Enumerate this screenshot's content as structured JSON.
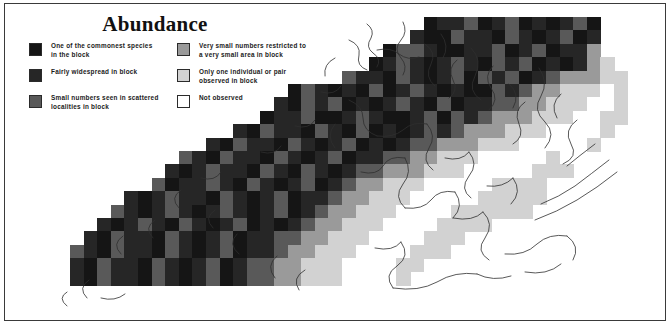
{
  "figure": {
    "title": "Abundance",
    "width": 670,
    "height": 325,
    "background": "#ffffff",
    "border_color": "#3a3a3a"
  },
  "legend": {
    "columns": [
      {
        "name": "left",
        "items": [
          {
            "swatch": "#151515",
            "label": "One of the commonest species\nin the block",
            "level": 5
          },
          {
            "swatch": "#262626",
            "label": "Fairly widespread in block",
            "level": 4
          },
          {
            "swatch": "#595959",
            "label": "Small numbers seen in scattered\nlocalities in block",
            "level": 3
          }
        ]
      },
      {
        "name": "right",
        "items": [
          {
            "swatch": "#9a9a9a",
            "label": "Very small numbers restricted to\na very small area in block",
            "level": 2
          },
          {
            "swatch": "#d2d2d2",
            "label": "Only one individual or pair\nobserved in block",
            "level": 1
          },
          {
            "swatch": "#ffffff",
            "label": "Not observed",
            "level": 0
          }
        ]
      }
    ]
  },
  "chart_data": {
    "type": "heatmap",
    "title": "Abundance",
    "xlabel": "",
    "ylabel": "",
    "grid": false,
    "legend_position": "top-left",
    "cell_width": 13.6,
    "cell_height": 13.4,
    "origin_x": 65,
    "origin_y": 13,
    "palette": [
      "#ffffff",
      "#d2d2d2",
      "#9a9a9a",
      "#595959",
      "#262626",
      "#151515"
    ],
    "class_labels": [
      "Not observed",
      "Only one individual or pair observed in block",
      "Very small numbers restricted to a very small area in block",
      "Small numbers seen in scattered localities in block",
      "Fairly widespread in block",
      "One of the commonest species in block"
    ],
    "ncols": 44,
    "nrows": 22,
    "rows": [
      "..........................5443543545435......",
      ".........................45534453454354......",
      ".......................5334554435435442......",
      "......................543454345343545421.....",
      "....................344534543534354322211....",
      "................5345453543454553432211101....",
      "...............45343545434535443322111001....",
      "..............544355434554353432221110011....",
      "............4534453453545434322211100001.....",
      "..........45344534543545433222111000001......",
      "........3453445345435443322111000001.........",
      ".......454344534534543322211100000111........",
      "......35443453454354322111000001111..........",
      "....4543445345435443221110000011111..........",
      "...3454345434543543221110000111111...........",
      "..45434534543545432211100001111..............",
      ".4534453454354433221110000111................",
      "3453445345435443221110000111.................",
      "45344534543543322111000011...................",
      "4534453454354332211100001...................."
    ]
  }
}
